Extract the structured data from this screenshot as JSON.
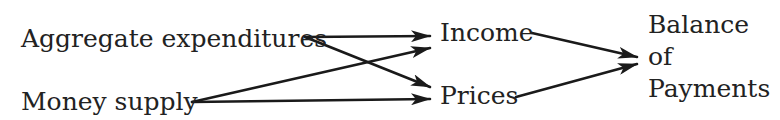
{
  "diagram": {
    "colors": {
      "text": "#222222",
      "arrow": "#1a1a1a",
      "background": "#ffffff"
    },
    "nodes": {
      "aggregate_expenditures": "Aggregate expenditures",
      "money_supply": "Money supply",
      "income": "Income",
      "prices": "Prices",
      "balance_of_payments": [
        "Balance",
        "of",
        "Payments"
      ]
    },
    "edges": [
      {
        "from": "Aggregate expenditures",
        "to": "Income"
      },
      {
        "from": "Aggregate expenditures",
        "to": "Prices"
      },
      {
        "from": "Money supply",
        "to": "Income"
      },
      {
        "from": "Money supply",
        "to": "Prices"
      },
      {
        "from": "Income",
        "to": "Balance of Payments"
      },
      {
        "from": "Prices",
        "to": "Balance of Payments"
      }
    ]
  }
}
